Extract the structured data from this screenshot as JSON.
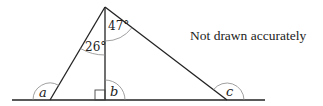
{
  "diagram": {
    "note": "Not drawn accurately",
    "angles": {
      "top_left": "26°",
      "top_right": "47°",
      "a": "a",
      "b": "b",
      "c": "c"
    },
    "points": {
      "apex": [
        105,
        7
      ],
      "left_vertex": [
        50,
        100
      ],
      "right_vertex": [
        227,
        100
      ],
      "foot": [
        105,
        100
      ],
      "baseline_start": [
        12,
        100
      ],
      "baseline_end": [
        265,
        100
      ]
    },
    "colors": {
      "line": "#222222",
      "arc": "#888888",
      "text": "#222222"
    }
  }
}
